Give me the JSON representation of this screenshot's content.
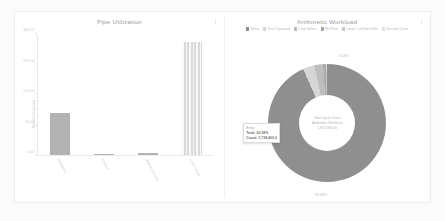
{
  "chart_data": [
    {
      "type": "bar",
      "title": "Pipe Utilization",
      "xlabel": "",
      "ylabel": "Minutes Elapsed",
      "categories": [
        "Arithmetic",
        "Control",
        "Memory Access",
        "Load / Store"
      ],
      "values": [
        105,
        0,
        6,
        281
      ],
      "ylim": [
        0,
        300
      ],
      "yticks": [
        0,
        75,
        150,
        225,
        300
      ],
      "ytick_labels": [
        "0.00",
        "75.00",
        "150.00",
        "225.00",
        "300.00"
      ],
      "grid": false,
      "legend": "none",
      "series_styles": [
        "solid",
        "solid",
        "solid",
        "hatched"
      ]
    },
    {
      "type": "pie",
      "title": "Arithmetic Workload",
      "legend_position": "top",
      "labels": [
        "Entry",
        "First Operand",
        "Chip Select",
        "Bit Row",
        "Load / Ld Row Fifth",
        "Second Clear"
      ],
      "slices": [
        {
          "label": "Entry",
          "percent": 93.38,
          "color": "#8f8f8f"
        },
        {
          "label": "First Operand",
          "percent": 3.14,
          "color": "#d5d5d5"
        },
        {
          "label": "Chip Select",
          "percent": 2.47,
          "color": "#bdbdbd"
        },
        {
          "label": "Bit Row",
          "percent": 0.61,
          "color": "#a8a8a8"
        },
        {
          "label": "Load / Ld Row Fifth",
          "percent": 0.25,
          "color": "#c8c8c8"
        },
        {
          "label": "Second Clear",
          "percent": 0.15,
          "color": "#e0e0e0"
        }
      ],
      "slice_labels": [
        {
          "text": "3.14%",
          "x": 58,
          "y": 5
        },
        {
          "text": "93.38%",
          "x": 47,
          "y": 98
        }
      ],
      "center_text": [
        "Total Cycle Count",
        "Arithmetic Workload",
        "1,872,094.00"
      ],
      "tooltip": {
        "name": "Entry",
        "percent_label": "Total: 93.38%",
        "value_label": "Count: 1,738,462.0"
      }
    }
  ],
  "card": {
    "left_panel": {
      "title": "Pipe Utilization",
      "menu_icon": "kebab-menu-icon"
    },
    "right_panel": {
      "title": "Arithmetic Workload",
      "menu_icon": "kebab-menu-icon"
    }
  }
}
